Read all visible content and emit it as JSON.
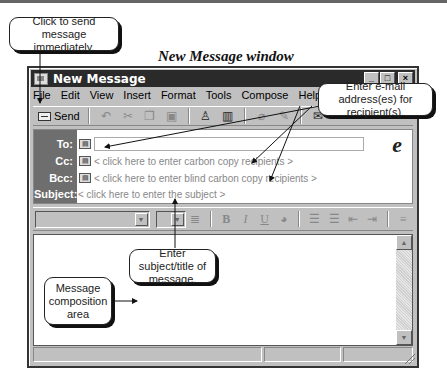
{
  "figure": {
    "caption": "New Message window"
  },
  "window": {
    "title": "New Message",
    "controls": {
      "minimize": "_",
      "maximize": "□",
      "close": "×"
    },
    "menu": [
      {
        "label": "File",
        "accel": "i"
      },
      {
        "label": "Edit",
        "accel": "E"
      },
      {
        "label": "View",
        "accel": "V"
      },
      {
        "label": "Insert",
        "accel": "I"
      },
      {
        "label": "Format",
        "accel": "o"
      },
      {
        "label": "Tools",
        "accel": "T"
      },
      {
        "label": "Compose",
        "accel": "C"
      },
      {
        "label": "Help",
        "accel": "H"
      }
    ],
    "toolbar": {
      "send_label": "Send",
      "icons": [
        "undo-icon",
        "cut-icon",
        "copy-icon",
        "paste-icon",
        "check-names-icon",
        "address-book-icon",
        "attach-icon",
        "sign-icon",
        "encrypt-icon"
      ]
    },
    "header": {
      "to_label": "To:",
      "to_value": "",
      "cc_label": "Cc:",
      "cc_hint": "< click here to enter carbon copy recipients >",
      "bcc_label": "Bcc:",
      "bcc_hint": "< click here to enter blind carbon copy recipients >",
      "subject_label": "Subject:",
      "subject_hint": "< click here to enter the subject >",
      "addr_icon": "▤"
    },
    "format_bar": {
      "font_value": "",
      "size_value": "",
      "buttons": [
        "B",
        "I",
        "U"
      ]
    },
    "body": {
      "text": ""
    }
  },
  "callouts": {
    "send": "Click to send message immediately.",
    "recipients": "Enter e-mail address(es) for recipient(s).",
    "subject": "Enter subject/title of message.",
    "composition": "Message composition area"
  }
}
